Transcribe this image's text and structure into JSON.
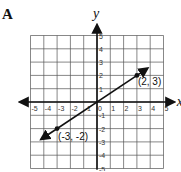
{
  "panel_label": "A",
  "chart_data": {
    "type": "line",
    "title": "",
    "xlabel": "x",
    "ylabel": "y",
    "xlim": [
      -5,
      5
    ],
    "ylim": [
      -5,
      5
    ],
    "grid": true,
    "x_ticks": [
      "-5",
      "-4",
      "-3",
      "-2",
      "-1",
      "0",
      "1",
      "2",
      "3",
      "4",
      "5"
    ],
    "y_ticks": [
      "5",
      "4",
      "3",
      "2",
      "1",
      "-1",
      "-2",
      "-3",
      "-4",
      "-5"
    ],
    "series": [
      {
        "name": "line",
        "x": [
          -4.2,
          3.8
        ],
        "y": [
          -2.8,
          2.53
        ],
        "arrows": "both"
      }
    ],
    "points": [
      {
        "x": 3,
        "y": 2,
        "label": "(2, 3)"
      },
      {
        "x": -3,
        "y": -2,
        "label": "(-3, -2)"
      }
    ]
  }
}
